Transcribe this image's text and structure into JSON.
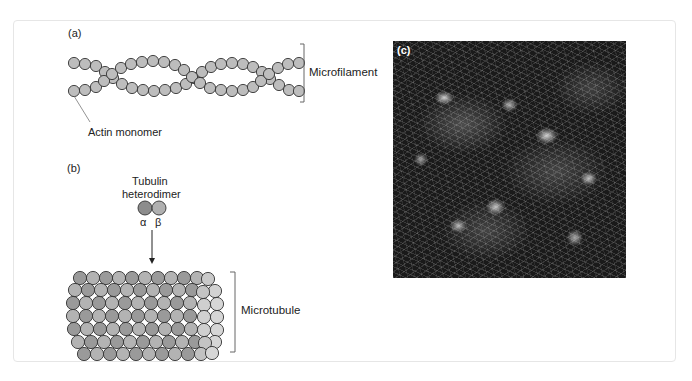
{
  "figure": {
    "panel_a": {
      "letter": "(a)",
      "structure_label": "Microfilament",
      "monomer_label": "Actin monomer",
      "bead_fill": "#bdbdbd",
      "bead_stroke": "#333333"
    },
    "panel_b": {
      "letter": "(b)",
      "dimer_title_line1": "Tubulin",
      "dimer_title_line2": "heterodimer",
      "alpha_label": "α",
      "beta_label": "β",
      "alpha_color": "#8c8c8c",
      "beta_color": "#b0b0b0",
      "structure_label": "Microtubule"
    },
    "panel_c": {
      "letter": "(c)",
      "description": "Fluorescence micrograph of cytoskeletal filaments in cells (grayscale)"
    }
  }
}
